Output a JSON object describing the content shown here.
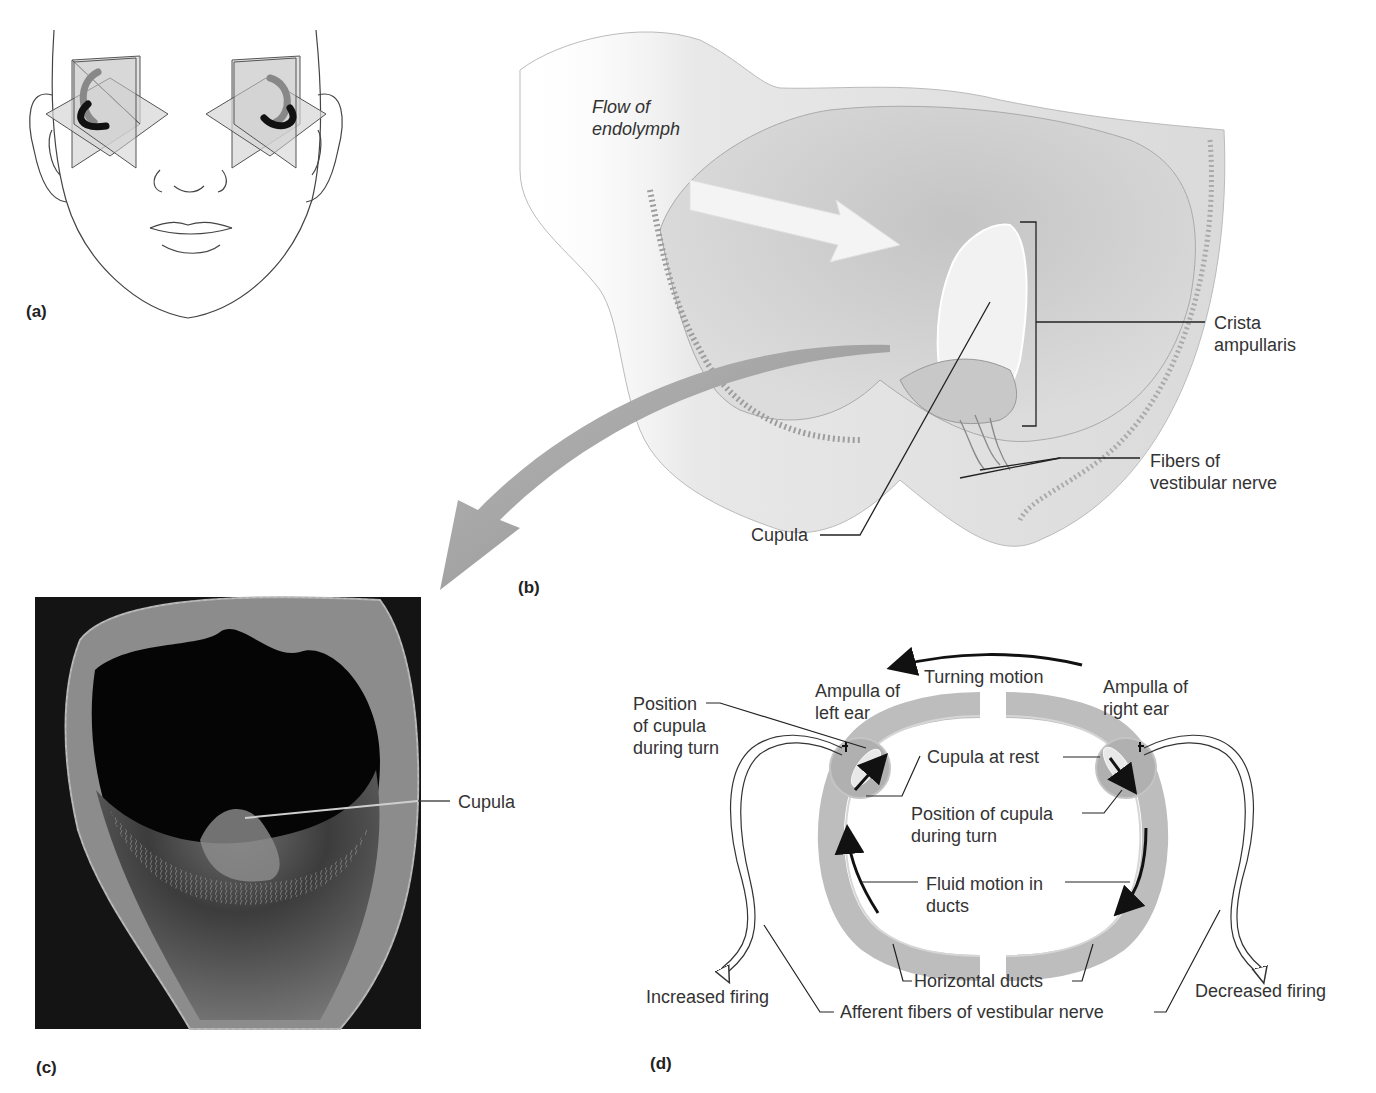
{
  "figure": {
    "colors": {
      "duct_gray": "#bdbdbd",
      "ampulla_gray": "#b0b0b0",
      "tissue_light": "#e6e6e6",
      "tissue_mid": "#d2d2d2",
      "sem_background": "#121212",
      "line": "#1e1e1e",
      "arrow_gray": "#9a9a9a"
    }
  },
  "panels": {
    "a": {
      "label": "(a)",
      "subject": "face-with-semicircular-canal-planes",
      "structures": [
        "left-ear-canal-planes",
        "right-ear-canal-planes"
      ]
    },
    "b": {
      "label": "(b)",
      "subject": "cutaway-ampulla-illustration",
      "labels": {
        "flow": "Flow of\nendolymph",
        "crista": "Crista\nampullaris",
        "fibers": "Fibers of\nvestibular nerve",
        "cupula": "Cupula"
      }
    },
    "c": {
      "label": "(c)",
      "subject": "scanning-electron-micrograph-of-ampulla",
      "labels": {
        "cupula": "Cupula"
      }
    },
    "d": {
      "label": "(d)",
      "subject": "horizontal-ducts-during-turn",
      "labels": {
        "turning_motion": "Turning motion",
        "ampulla_left": "Ampulla of\nleft ear",
        "ampulla_right": "Ampulla of\nright ear",
        "position_left": "Position\nof cupula\nduring turn",
        "cupula_rest": "Cupula at rest",
        "position_right": "Position of cupula\nduring turn",
        "fluid_motion": "Fluid motion in\nducts",
        "horizontal_ducts": "Horizontal ducts",
        "increased_firing": "Increased firing",
        "decreased_firing": "Decreased firing",
        "afferent_fibers": "Afferent fibers of vestibular nerve"
      }
    }
  }
}
